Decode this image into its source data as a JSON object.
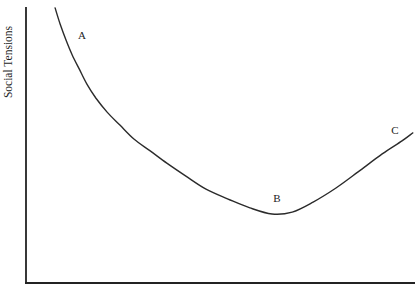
{
  "figure": {
    "background": "#ffffff",
    "axis_color": "#232323",
    "text_color": "#1c1c1c"
  },
  "chart_data": {
    "type": "line",
    "title": "",
    "xlabel": "",
    "ylabel": "Social Tensions",
    "x_axis": {
      "tick_labels": [],
      "axis_line": true
    },
    "y_axis": {
      "tick_labels": [],
      "axis_line": true
    },
    "grid": false,
    "legend": false,
    "series": [
      {
        "name": "social-tensions-curve",
        "color": "#2b2b2b",
        "points_norm": [
          [
            0.075,
            0.993
          ],
          [
            0.088,
            0.935
          ],
          [
            0.103,
            0.877
          ],
          [
            0.119,
            0.823
          ],
          [
            0.137,
            0.773
          ],
          [
            0.157,
            0.718
          ],
          [
            0.18,
            0.668
          ],
          [
            0.209,
            0.617
          ],
          [
            0.242,
            0.57
          ],
          [
            0.278,
            0.52
          ],
          [
            0.32,
            0.477
          ],
          [
            0.363,
            0.433
          ],
          [
            0.412,
            0.386
          ],
          [
            0.464,
            0.339
          ],
          [
            0.521,
            0.303
          ],
          [
            0.577,
            0.271
          ],
          [
            0.634,
            0.249
          ],
          [
            0.686,
            0.256
          ],
          [
            0.74,
            0.292
          ],
          [
            0.799,
            0.343
          ],
          [
            0.856,
            0.401
          ],
          [
            0.918,
            0.466
          ],
          [
            0.969,
            0.513
          ],
          [
            0.997,
            0.542
          ]
        ]
      }
    ],
    "annotations": [
      {
        "label": "A",
        "x_norm": 0.144,
        "y_norm": 0.895
      },
      {
        "label": "B",
        "x_norm": 0.647,
        "y_norm": 0.307
      },
      {
        "label": "C",
        "x_norm": 0.951,
        "y_norm": 0.552
      }
    ]
  }
}
